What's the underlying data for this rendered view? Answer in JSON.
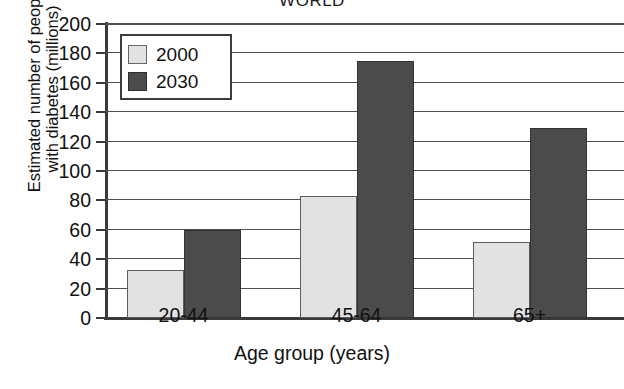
{
  "chart_data": {
    "type": "bar",
    "title": "WORLD",
    "xlabel": "Age group (years)",
    "ylabel_line1": "Estimated number of people",
    "ylabel_line2": "with diabetes (millions)",
    "categories": [
      "20-44",
      "45-64",
      "65+"
    ],
    "series": [
      {
        "name": "2000",
        "values": [
          33,
          83,
          52
        ],
        "color": "#e2e2e2"
      },
      {
        "name": "2030",
        "values": [
          60,
          175,
          129
        ],
        "color": "#4b4b4b"
      }
    ],
    "ylim": [
      0,
      200
    ],
    "ytick_step": 20,
    "yticks": [
      200,
      180,
      160,
      140,
      120,
      100,
      80,
      60,
      40,
      20,
      0
    ],
    "grid": "horizontal",
    "legend_position": "top-left-inside"
  },
  "legend": {
    "entries": [
      {
        "label": "2000"
      },
      {
        "label": "2030"
      }
    ]
  }
}
